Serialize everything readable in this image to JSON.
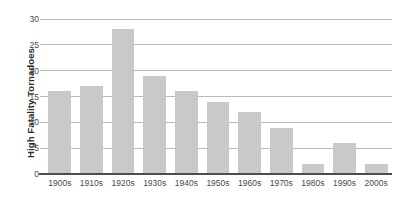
{
  "chart_data": {
    "type": "bar",
    "title": "",
    "xlabel": "",
    "ylabel": "High Fatality Tornadoes",
    "categories": [
      "1900s",
      "1910s",
      "1920s",
      "1930s",
      "1940s",
      "1950s",
      "1960s",
      "1970s",
      "1980s",
      "1990s",
      "2000s"
    ],
    "values": [
      16,
      17,
      28,
      19,
      16,
      14,
      12,
      9,
      2,
      6,
      2
    ],
    "ylim": [
      0,
      30
    ],
    "yticks": [
      0,
      5,
      10,
      15,
      20,
      25,
      30
    ],
    "ytick_labels": [
      "0",
      "5",
      "10",
      "15",
      "20",
      "25",
      "30"
    ],
    "grid": true,
    "legend": false,
    "series": [
      {
        "name": "High Fatality Tornadoes",
        "values": [
          16,
          17,
          28,
          19,
          16,
          14,
          12,
          9,
          2,
          6,
          2
        ]
      }
    ]
  },
  "style": {
    "bar_color": "#c9c9c9",
    "gridline_color": "#b9b9b9",
    "axis_color": "#4d4d4d",
    "text_color": "#4a4a4a",
    "title_color": "#2b2b2b",
    "background": "#ffffff"
  }
}
